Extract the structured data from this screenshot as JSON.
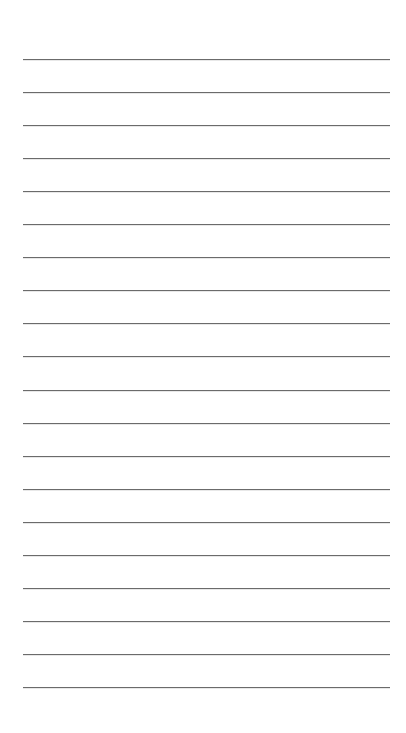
{
  "page": {
    "type": "lined-paper",
    "background_color": "#ffffff",
    "line_color": "#6b6b6b",
    "line_count": 20,
    "line_left_px": 23,
    "line_right_px": 390,
    "first_line_y_px": 59,
    "line_spacing_px": 33.05
  }
}
